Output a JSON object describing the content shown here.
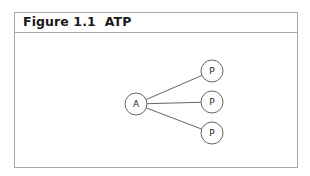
{
  "figure": {
    "title": "Figure 1.1  ATP"
  },
  "diagram": {
    "nodes": [
      {
        "id": "A",
        "label": "A",
        "cx": 136,
        "cy": 104,
        "r": 11
      },
      {
        "id": "P1",
        "label": "P",
        "cx": 212,
        "cy": 71,
        "r": 11
      },
      {
        "id": "P2",
        "label": "P",
        "cx": 212,
        "cy": 102,
        "r": 11
      },
      {
        "id": "P3",
        "label": "P",
        "cx": 212,
        "cy": 133,
        "r": 11
      }
    ],
    "edges": [
      {
        "from": "A",
        "to": "P1"
      },
      {
        "from": "A",
        "to": "P2"
      },
      {
        "from": "A",
        "to": "P3"
      }
    ],
    "colors": {
      "stroke": "#555555",
      "border": "#a8a8a8"
    }
  }
}
